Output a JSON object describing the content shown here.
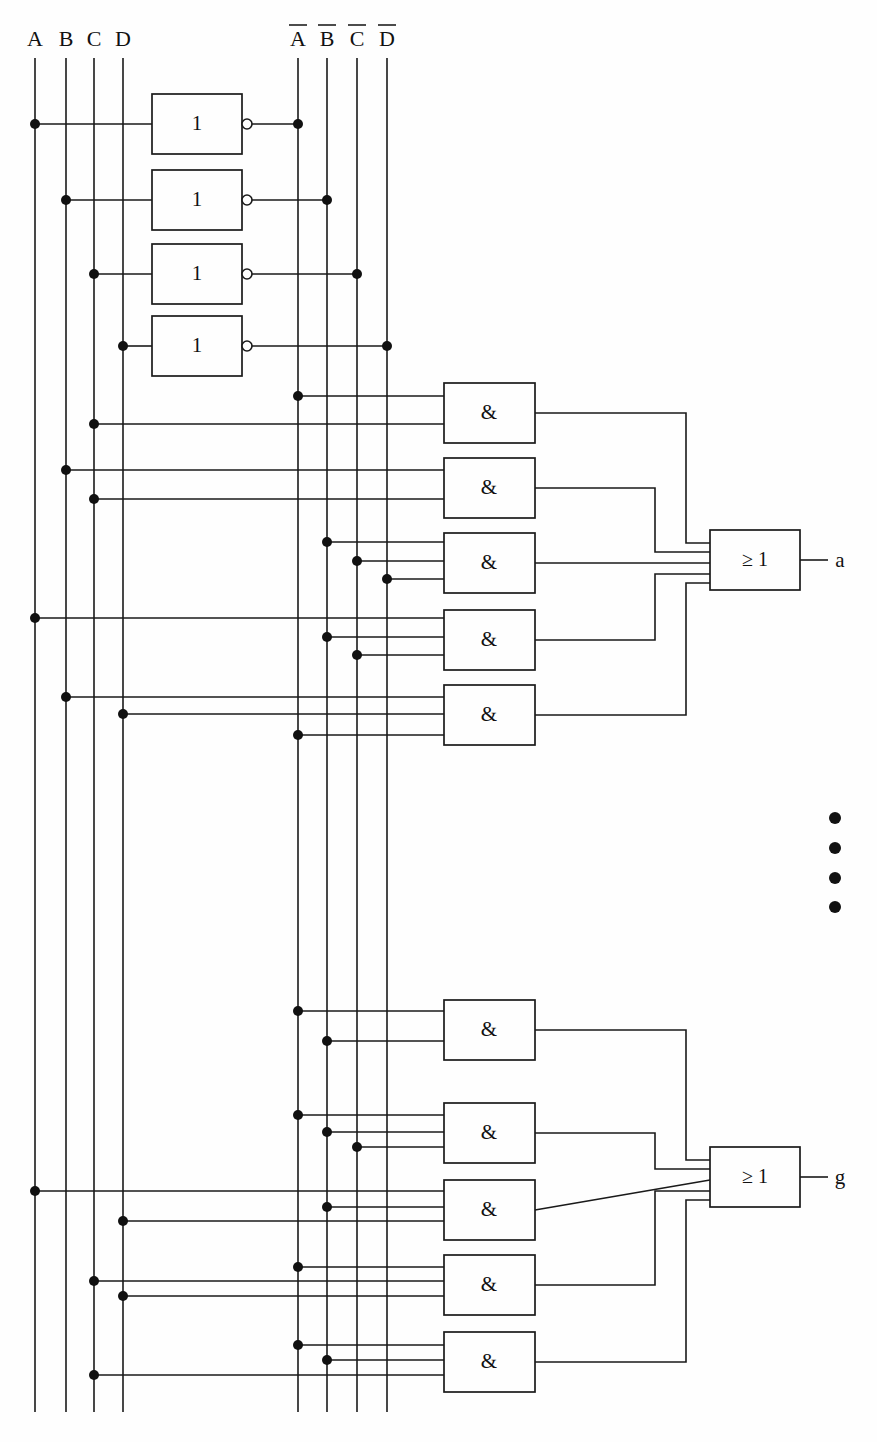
{
  "diagram": {
    "type": "logic-circuit",
    "background_color": "#fefefe",
    "line_color": "#1a1a1a"
  },
  "inputs": [
    {
      "id": "A",
      "label": "A",
      "bar": false,
      "x": 35
    },
    {
      "id": "B",
      "label": "B",
      "bar": false,
      "x": 66
    },
    {
      "id": "C",
      "label": "C",
      "bar": false,
      "x": 94
    },
    {
      "id": "D",
      "label": "D",
      "bar": false,
      "x": 123
    }
  ],
  "inverted_inputs": [
    {
      "id": "nA",
      "label": "A",
      "bar": true,
      "x": 298
    },
    {
      "id": "nB",
      "label": "B",
      "bar": true,
      "x": 327
    },
    {
      "id": "nC",
      "label": "C",
      "bar": true,
      "x": 357
    },
    {
      "id": "nD",
      "label": "D",
      "bar": true,
      "x": 387
    }
  ],
  "inverters": [
    {
      "name": "inverter-a",
      "label": "1",
      "source": "A",
      "target": "nA",
      "y": 124
    },
    {
      "name": "inverter-b",
      "label": "1",
      "source": "B",
      "target": "nB",
      "y": 200
    },
    {
      "name": "inverter-c",
      "label": "1",
      "source": "C",
      "target": "nC",
      "y": 274
    },
    {
      "name": "inverter-d",
      "label": "1",
      "source": "D",
      "target": "nD",
      "y": 346
    }
  ],
  "and_gates": [
    {
      "name": "and-gate-1",
      "label": "&",
      "y_top": 383,
      "inputs": [
        {
          "signal": "nA",
          "y": 396
        },
        {
          "signal": "C",
          "y": 424
        }
      ]
    },
    {
      "name": "and-gate-2",
      "label": "&",
      "y_top": 458,
      "inputs": [
        {
          "signal": "B",
          "y": 470
        },
        {
          "signal": "C",
          "y": 499
        }
      ]
    },
    {
      "name": "and-gate-3",
      "label": "&",
      "y_top": 533,
      "inputs": [
        {
          "signal": "nB",
          "y": 542
        },
        {
          "signal": "nC",
          "y": 561
        },
        {
          "signal": "nD",
          "y": 579
        }
      ]
    },
    {
      "name": "and-gate-4",
      "label": "&",
      "y_top": 610,
      "inputs": [
        {
          "signal": "A",
          "y": 618
        },
        {
          "signal": "nB",
          "y": 637
        },
        {
          "signal": "nC",
          "y": 655
        }
      ]
    },
    {
      "name": "and-gate-5",
      "label": "&",
      "y_top": 685,
      "inputs": [
        {
          "signal": "B",
          "y": 697
        },
        {
          "signal": "D",
          "y": 714
        },
        {
          "signal": "nA",
          "y": 735
        }
      ]
    },
    {
      "name": "and-gate-6",
      "label": "&",
      "y_top": 1000,
      "inputs": [
        {
          "signal": "nA",
          "y": 1011
        },
        {
          "signal": "nB",
          "y": 1041
        }
      ]
    },
    {
      "name": "and-gate-7",
      "label": "&",
      "y_top": 1103,
      "inputs": [
        {
          "signal": "Ag",
          "y": 1115
        },
        {
          "signal": "nB",
          "y": 1132
        },
        {
          "signal": "nC",
          "y": 1147
        }
      ]
    },
    {
      "name": "and-gate-8",
      "label": "&",
      "y_top": 1180,
      "inputs": [
        {
          "signal": "A",
          "y": 1191
        },
        {
          "signal": "nB",
          "y": 1207
        },
        {
          "signal": "C",
          "y": 1221
        }
      ]
    },
    {
      "name": "and-gate-9",
      "label": "&",
      "y_top": 1255,
      "inputs": [
        {
          "signal": "nA",
          "y": 1267
        },
        {
          "signal": "B",
          "y": 1281
        },
        {
          "signal": "C",
          "y": 1296
        }
      ]
    },
    {
      "name": "and-gate-10",
      "label": "&",
      "y_top": 1332,
      "inputs": [
        {
          "signal": "nA",
          "y": 1345
        },
        {
          "signal": "nB",
          "y": 1360
        },
        {
          "signal": "C",
          "y": 1375
        }
      ]
    }
  ],
  "or_gates": [
    {
      "name": "or-gate-a",
      "label": "≥ 1",
      "output_label": "a",
      "y_center": 560,
      "feeds": [
        "and-gate-1",
        "and-gate-2",
        "and-gate-3",
        "and-gate-4",
        "and-gate-5"
      ]
    },
    {
      "name": "or-gate-g",
      "label": "≥ 1",
      "output_label": "g",
      "y_center": 1177,
      "feeds": [
        "and-gate-6",
        "and-gate-7",
        "and-gate-8",
        "and-gate-9",
        "and-gate-10"
      ]
    }
  ],
  "outputs": [
    {
      "name": "output-a",
      "label": "a",
      "x": 840,
      "y": 566
    },
    {
      "name": "output-g",
      "label": "g",
      "x": 840,
      "y": 1184
    }
  ],
  "ellipsis": {
    "name": "vertical-ellipsis",
    "count": 4,
    "x": 835,
    "y_values": [
      818,
      848,
      878,
      907
    ]
  },
  "geometry": {
    "inverter_box": {
      "x": 152,
      "width": 90,
      "height": 60,
      "bubble_r": 5
    },
    "and_box": {
      "x": 444,
      "width": 91,
      "height": 60
    },
    "or_box": {
      "x": 710,
      "width": 90,
      "height": 60
    },
    "rail_top": 50,
    "rail_bottom": 1412,
    "junction_r": 5
  }
}
